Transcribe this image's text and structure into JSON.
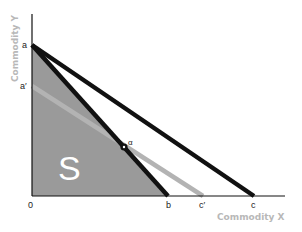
{
  "diagram": {
    "axes": {
      "x_title": "Commodity X",
      "y_title": "Commodity Y",
      "origin_label": "0"
    },
    "points": {
      "a": "a",
      "a_prime": "a′",
      "b": "b",
      "c_prime": "c′",
      "c": "c",
      "alpha": "α"
    },
    "region_label": "S",
    "lines": [
      {
        "name": "budget-line-ab",
        "from": "a",
        "to": "b",
        "color": "#111111"
      },
      {
        "name": "budget-line-ac",
        "from": "a",
        "to": "c",
        "color": "#111111"
      },
      {
        "name": "budget-line-a-prime-c-prime",
        "from": "a′",
        "to": "c′",
        "color": "#b0b0b0"
      }
    ],
    "colors": {
      "region_fill": "#9a9a9a",
      "bold_line": "#111111",
      "gray_line": "#b3b3b3",
      "axis_title": "#b8b8b8"
    }
  }
}
